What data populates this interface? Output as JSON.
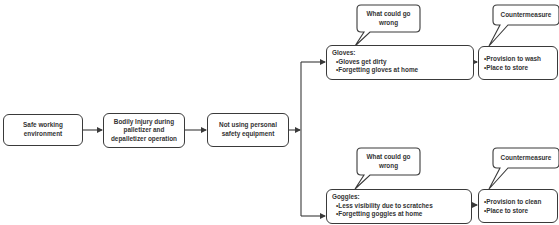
{
  "diagram": {
    "flow": [
      {
        "id": "safe",
        "label": "Safe working environment"
      },
      {
        "id": "injury",
        "label": "Bodily Injury during palletizer and depalletizer operation"
      },
      {
        "id": "notusing",
        "label": "Not using personal safety equipment"
      }
    ],
    "branches": [
      {
        "id": "gloves",
        "title": "Gloves:",
        "items": [
          "•Gloves get dirty",
          "•Forgetting gloves at home"
        ],
        "callout": "What could go wrong",
        "countermeasure": {
          "callout": "Countermeasure",
          "items": [
            "•Provision to wash",
            "•Place to store"
          ]
        }
      },
      {
        "id": "goggles",
        "title": "Goggles:",
        "items": [
          "•Less visibility due to scratches",
          "•Forgetting goggles at home"
        ],
        "callout": "What could go wrong",
        "countermeasure": {
          "callout": "Countermeasure",
          "items": [
            "•Provision to clean",
            "•Place to store"
          ]
        }
      }
    ],
    "colors": {
      "stroke": "#3a3a3a",
      "text": "#333333",
      "background": "#ffffff"
    }
  }
}
